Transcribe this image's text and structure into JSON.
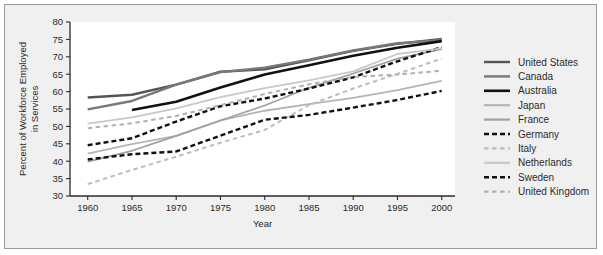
{
  "figure": {
    "background_color": "#f0f0f0",
    "plot_background_color": "#ffffff",
    "frame_border_color": "#9a9a9a",
    "axis_color": "#2b2b2b"
  },
  "chart_data": {
    "type": "line",
    "title": "",
    "xlabel": "Year",
    "ylabel": "Percent of Workforce Employed in Services",
    "ylabel_line1": "Percent of Workforce Employed",
    "ylabel_line2": "in Services",
    "x": [
      1960,
      1965,
      1970,
      1975,
      1980,
      1985,
      1990,
      1995,
      2000
    ],
    "xlim": [
      1958,
      2001.5
    ],
    "ylim": [
      30,
      80
    ],
    "xticks": [
      1960,
      1965,
      1970,
      1975,
      1980,
      1985,
      1990,
      1995,
      2000
    ],
    "xtick_labels": [
      "1960",
      "1965",
      "1970",
      "1975",
      "1980",
      "1985",
      "1990",
      "1995",
      "2000"
    ],
    "yticks": [
      30,
      35,
      40,
      45,
      50,
      55,
      60,
      65,
      70,
      75,
      80
    ],
    "ytick_labels": [
      "30",
      "35",
      "40",
      "45",
      "50",
      "55",
      "60",
      "65",
      "70",
      "75",
      "80"
    ],
    "grid": false,
    "legend_position": "right",
    "series": [
      {
        "name": "United States",
        "color": "#555555",
        "dash": "solid",
        "width": 2.4,
        "x": [
          1960,
          1965,
          1970,
          1975,
          1980,
          1985,
          1990,
          1995,
          2000
        ],
        "values": [
          58.3,
          59.1,
          62.0,
          65.7,
          66.4,
          69.0,
          71.7,
          73.7,
          75.1
        ]
      },
      {
        "name": "Canada",
        "color": "#787878",
        "dash": "solid",
        "width": 2.4,
        "x": [
          1960,
          1965,
          1970,
          1975,
          1980,
          1985,
          1990,
          1995,
          2000
        ],
        "values": [
          54.9,
          57.3,
          62.0,
          65.6,
          66.9,
          69.2,
          71.8,
          73.9,
          74.8
        ]
      },
      {
        "name": "Australia",
        "color": "#111111",
        "dash": "solid",
        "width": 2.6,
        "x": [
          1965,
          1970,
          1975,
          1980,
          1985,
          1990,
          1995,
          2000
        ],
        "values": [
          54.7,
          57.1,
          61.2,
          64.9,
          67.6,
          70.3,
          72.6,
          74.5
        ]
      },
      {
        "name": "Japan",
        "color": "#b4b4b4",
        "dash": "solid",
        "width": 1.8,
        "x": [
          1960,
          1965,
          1970,
          1975,
          1980,
          1985,
          1990,
          1995,
          2000
        ],
        "values": [
          42.2,
          44.9,
          47.3,
          51.7,
          54.5,
          56.4,
          58.2,
          60.4,
          63.1
        ]
      },
      {
        "name": "France",
        "color": "#a0a0a0",
        "dash": "solid",
        "width": 1.8,
        "x": [
          1960,
          1965,
          1970,
          1975,
          1980,
          1985,
          1990,
          1995,
          2000
        ],
        "values": [
          39.9,
          43.0,
          47.3,
          51.7,
          56.0,
          61.1,
          65.2,
          69.5,
          72.2
        ]
      },
      {
        "name": "Germany",
        "color": "#111111",
        "dash": "dashed",
        "width": 2.4,
        "x": [
          1960,
          1965,
          1970,
          1975,
          1980,
          1985,
          1990,
          1995,
          2000
        ],
        "values": [
          44.6,
          46.6,
          51.4,
          55.8,
          58.0,
          60.9,
          64.1,
          68.7,
          72.8
        ]
      },
      {
        "name": "Italy",
        "color": "#bdbdbd",
        "dash": "dashed",
        "width": 2.0,
        "x": [
          1960,
          1965,
          1970,
          1975,
          1980,
          1985,
          1990,
          1995,
          2000
        ],
        "values": [
          33.4,
          37.5,
          41.3,
          45.3,
          49.0,
          56.1,
          60.9,
          65.1,
          69.5
        ]
      },
      {
        "name": "Netherlands",
        "color": "#c8c8c8",
        "dash": "solid",
        "width": 1.8,
        "x": [
          1960,
          1965,
          1970,
          1975,
          1980,
          1985,
          1990,
          1995,
          2000
        ],
        "values": [
          50.8,
          52.6,
          55.2,
          58.4,
          61.0,
          63.2,
          65.8,
          70.8,
          72.4
        ]
      },
      {
        "name": "Sweden",
        "color": "#111111",
        "dash": "dashed",
        "width": 2.4,
        "x": [
          1960,
          1965,
          1970,
          1980,
          1985,
          1990,
          1995,
          2000
        ],
        "values": [
          40.5,
          42.0,
          42.8,
          51.9,
          53.3,
          55.4,
          57.6,
          60.2
        ]
      },
      {
        "name": "United Kingdom",
        "color": "#b0b0b0",
        "dash": "dashed",
        "width": 2.0,
        "x": [
          1960,
          1965,
          1970,
          1975,
          1980,
          1985,
          1990,
          1995,
          2000
        ],
        "values": [
          49.5,
          50.9,
          53.0,
          56.1,
          59.3,
          62.1,
          64.2,
          64.9,
          66.0
        ]
      }
    ]
  },
  "legend": {
    "entries": [
      {
        "label": "United States"
      },
      {
        "label": "Canada"
      },
      {
        "label": "Australia"
      },
      {
        "label": "Japan"
      },
      {
        "label": "France"
      },
      {
        "label": "Germany"
      },
      {
        "label": "Italy"
      },
      {
        "label": "Netherlands"
      },
      {
        "label": "Sweden"
      },
      {
        "label": "United Kingdom"
      }
    ]
  }
}
